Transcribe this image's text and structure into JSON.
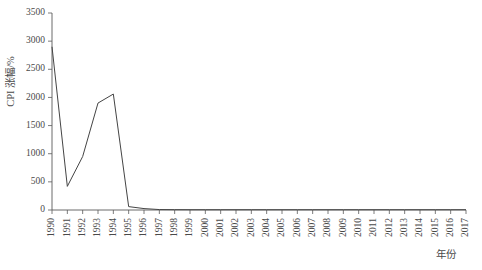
{
  "chart_data": {
    "type": "line",
    "title": "",
    "xlabel": "年份",
    "ylabel": "CPI 涨幅/%",
    "xlim": [
      1990,
      2017
    ],
    "ylim": [
      0,
      3500
    ],
    "grid": false,
    "legend": null,
    "yticks": [
      0,
      500,
      1000,
      1500,
      2000,
      2500,
      3000,
      3500
    ],
    "ytick_labels": [
      "0",
      "500",
      "1000",
      "1500",
      "2000",
      "2500",
      "3000",
      "3500"
    ],
    "categories": [
      "1990",
      "1991",
      "1992",
      "1993",
      "1994",
      "1995",
      "1996",
      "1997",
      "1998",
      "1999",
      "2000",
      "2001",
      "2002",
      "2003",
      "2004",
      "2005",
      "2006",
      "2007",
      "2008",
      "2009",
      "2010",
      "2011",
      "2012",
      "2013",
      "2014",
      "2015",
      "2016",
      "2017"
    ],
    "series": [
      {
        "name": "CPI 涨幅",
        "values": [
          2900,
          420,
          950,
          1900,
          2060,
          60,
          25,
          8,
          6,
          5,
          5,
          5,
          5,
          5,
          5,
          5,
          5,
          5,
          5,
          5,
          5,
          5,
          5,
          5,
          5,
          5,
          5,
          5
        ]
      }
    ]
  },
  "axes": {
    "y_axis_title": "CPI 涨幅/%",
    "x_axis_title": "年份"
  }
}
